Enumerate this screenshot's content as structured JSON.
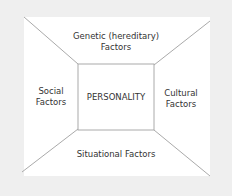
{
  "diagram": {
    "center": "PERSONALITY",
    "top": [
      "Genetic (hereditary)",
      "Factors"
    ],
    "left": [
      "Social",
      "Factors"
    ],
    "right": [
      "Cultural",
      "Factors"
    ],
    "bottom": "Situational Factors",
    "colors": {
      "background": "#efefef",
      "panel": "#ffffff",
      "line": "#b0b0b0"
    }
  }
}
